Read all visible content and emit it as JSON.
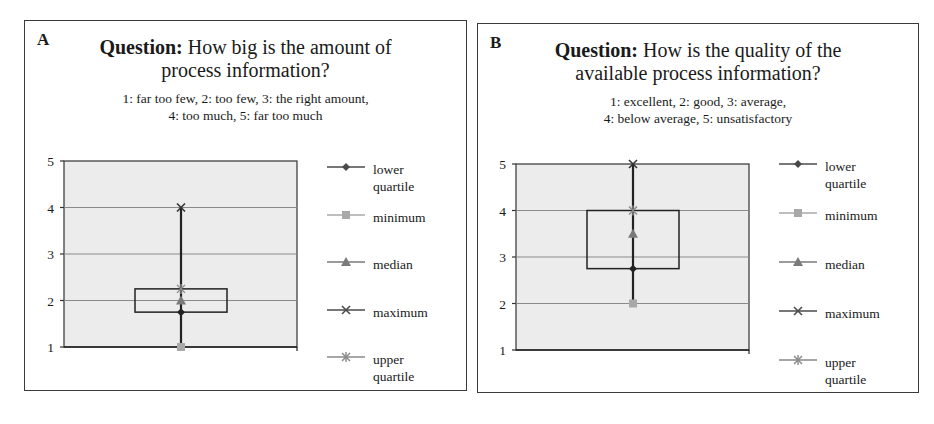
{
  "panels": [
    {
      "letter": "A",
      "title_bold": "Question:",
      "title_line1": " How big is the amount of",
      "title_line2": "process information?",
      "scale_line1": "1: far too few, 2: too few, 3: the right amount,",
      "scale_line2": "4: too much, 5: far too much"
    },
    {
      "letter": "B",
      "title_bold": "Question:",
      "title_line1": " How is the quality of the",
      "title_line2": "available process information?",
      "scale_line1": "1: excellent, 2: good, 3: average,",
      "scale_line2": "4: below average, 5: unsatisfactory"
    }
  ],
  "legend": [
    {
      "label_line1": "lower",
      "label_line2": "quartile",
      "marker": "diamond",
      "color": "#4a4a4a"
    },
    {
      "label_line1": "minimum",
      "label_line2": "",
      "marker": "square",
      "color": "#a8a8a8"
    },
    {
      "label_line1": "median",
      "label_line2": "",
      "marker": "triangle",
      "color": "#7a7a7a"
    },
    {
      "label_line1": "maximum",
      "label_line2": "",
      "marker": "x",
      "color": "#4a4a4a"
    },
    {
      "label_line1": "upper",
      "label_line2": "quartile",
      "marker": "star",
      "color": "#8a8a8a"
    }
  ],
  "y_ticks": [
    "1",
    "2",
    "3",
    "4",
    "5"
  ],
  "chart_data": [
    {
      "type": "boxplot",
      "title": "Question: How big is the amount of process information?",
      "subtitle": "1: far too few, 2: too few, 3: the right amount, 4: too much, 5: far too much",
      "xlabel": "",
      "ylabel": "",
      "ylim": [
        1,
        5
      ],
      "yticks": [
        1,
        2,
        3,
        4,
        5
      ],
      "grid": true,
      "legend_position": "right",
      "series": [
        {
          "name": "lower quartile",
          "values": [
            1.75
          ]
        },
        {
          "name": "minimum",
          "values": [
            1
          ]
        },
        {
          "name": "median",
          "values": [
            2
          ]
        },
        {
          "name": "maximum",
          "values": [
            4
          ]
        },
        {
          "name": "upper quartile",
          "values": [
            2.25
          ]
        }
      ]
    },
    {
      "type": "boxplot",
      "title": "Question: How is the quality of the available process information?",
      "subtitle": "1: excellent, 2: good, 3: average, 4: below average, 5: unsatisfactory",
      "xlabel": "",
      "ylabel": "",
      "ylim": [
        1,
        5
      ],
      "yticks": [
        1,
        2,
        3,
        4,
        5
      ],
      "grid": true,
      "legend_position": "right",
      "series": [
        {
          "name": "lower quartile",
          "values": [
            2.75
          ]
        },
        {
          "name": "minimum",
          "values": [
            2
          ]
        },
        {
          "name": "median",
          "values": [
            3.5
          ]
        },
        {
          "name": "maximum",
          "values": [
            5
          ]
        },
        {
          "name": "upper quartile",
          "values": [
            4
          ]
        }
      ]
    }
  ]
}
